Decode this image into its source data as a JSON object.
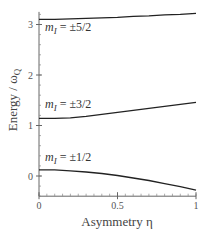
{
  "chart_data": {
    "type": "line",
    "title": "",
    "xlabel": "Asymmetry η",
    "ylabel": "Energy / ω",
    "ylabel_subscript": "Q",
    "xlim": [
      0,
      1
    ],
    "ylim": [
      -0.4,
      3.25
    ],
    "grid": false,
    "legend": "inline labels",
    "x_ticks": [
      {
        "value": 0,
        "label": "0"
      },
      {
        "value": 0.5,
        "label": "0.5"
      },
      {
        "value": 1,
        "label": "1"
      }
    ],
    "y_ticks": [
      {
        "value": 0,
        "label": "0"
      },
      {
        "value": 1,
        "label": "1"
      },
      {
        "value": 2,
        "label": "2"
      },
      {
        "value": 3,
        "label": "3"
      }
    ],
    "x": [
      0,
      0.1,
      0.2,
      0.3,
      0.4,
      0.5,
      0.6,
      0.7,
      0.8,
      0.9,
      1.0
    ],
    "series": [
      {
        "name": "m_I = ±5/2",
        "label_main": "m",
        "label_sub": "I",
        "label_rest": " = ±5/2",
        "values": [
          3.1,
          3.1,
          3.11,
          3.12,
          3.13,
          3.14,
          3.16,
          3.17,
          3.19,
          3.2,
          3.22
        ]
      },
      {
        "name": "m_I = ±3/2",
        "label_main": "m",
        "label_sub": "I",
        "label_rest": " = ±3/2",
        "values": [
          1.14,
          1.14,
          1.15,
          1.18,
          1.22,
          1.26,
          1.3,
          1.34,
          1.38,
          1.42,
          1.46
        ]
      },
      {
        "name": "m_I = ±1/2",
        "label_main": "m",
        "label_sub": "I",
        "label_rest": " = ±1/2",
        "values": [
          0.12,
          0.12,
          0.1,
          0.08,
          0.05,
          0.01,
          -0.04,
          -0.09,
          -0.15,
          -0.21,
          -0.28
        ]
      }
    ]
  }
}
